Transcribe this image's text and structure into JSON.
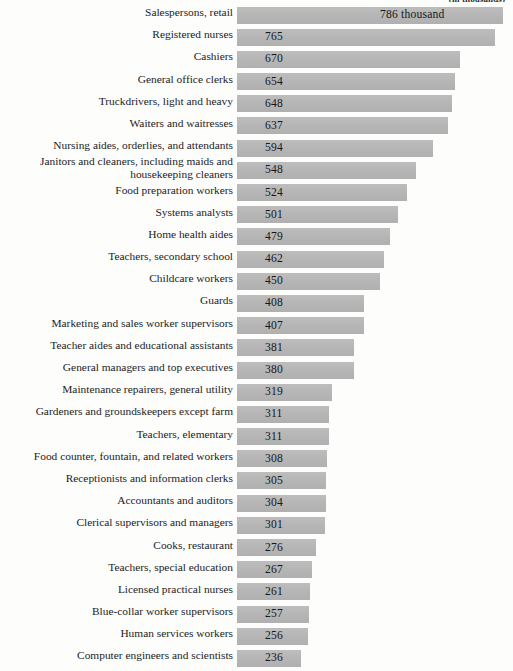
{
  "chart_data": {
    "type": "bar",
    "orientation": "horizontal",
    "title": "(in thousands)",
    "xlabel": "",
    "ylabel": "",
    "xlim": [
      0,
      786
    ],
    "grid": false,
    "legend": null,
    "value_suffix_first": "786 thousand",
    "categories": [
      "Salespersons, retail",
      "Registered nurses",
      "Cashiers",
      "General office clerks",
      "Truckdrivers, light and heavy",
      "Waiters and waitresses",
      "Nursing aides, orderlies, and attendants",
      "Janitors and cleaners, including maids and housekeeping cleaners",
      "Food preparation workers",
      "Systems analysts",
      "Home health aides",
      "Teachers, secondary school",
      "Childcare workers",
      "Guards",
      "Marketing and sales worker supervisors",
      "Teacher aides and educational assistants",
      "General managers and top executives",
      "Maintenance repairers, general utility",
      "Gardeners and groundskeepers except farm",
      "Teachers, elementary",
      "Food counter, fountain, and related workers",
      "Receptionists and information clerks",
      "Accountants and auditors",
      "Clerical supervisors and managers",
      "Cooks, restaurant",
      "Teachers, special education",
      "Licensed practical nurses",
      "Blue-collar worker supervisors",
      "Human services workers",
      "Computer engineers and scientists"
    ],
    "values": [
      786,
      765,
      670,
      654,
      648,
      637,
      594,
      548,
      524,
      501,
      479,
      462,
      450,
      408,
      407,
      381,
      380,
      319,
      311,
      311,
      308,
      305,
      304,
      301,
      276,
      267,
      261,
      257,
      256,
      236
    ],
    "value_labels": [
      "786 thousand",
      "765",
      "670",
      "654",
      "648",
      "637",
      "594",
      "548",
      "524",
      "501",
      "479",
      "462",
      "450",
      "408",
      "407",
      "381",
      "380",
      "319",
      "311",
      "311",
      "308",
      "305",
      "304",
      "301",
      "276",
      "267",
      "261",
      "257",
      "256",
      "236"
    ],
    "bar_color": "#b9b9b9",
    "background_color": "#fdfdfc",
    "text_color": "#1c1c1c"
  }
}
